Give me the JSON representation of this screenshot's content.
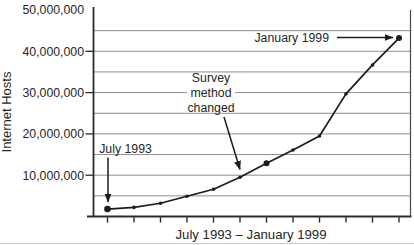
{
  "chart_data": {
    "type": "line",
    "title": "",
    "xlabel": "July 1993 – January 1999",
    "ylabel": "Internet Hosts",
    "x": [
      "Jul 1993",
      "Jan 1994",
      "Jul 1994",
      "Jan 1995",
      "Jul 1995",
      "Jan 1996",
      "Jul 1996",
      "Jan 1997",
      "Jul 1997",
      "Jan 1998",
      "Jul 1998",
      "Jan 1999"
    ],
    "values": [
      1800000,
      2200000,
      3200000,
      4900000,
      6600000,
      9500000,
      12900000,
      16100000,
      19500000,
      29700000,
      36700000,
      43200000
    ],
    "ylim": [
      0,
      50000000
    ],
    "y_ticks": [
      {
        "value": 50000000,
        "label": "50,000,000"
      },
      {
        "value": 40000000,
        "label": "40,000,000"
      },
      {
        "value": 30000000,
        "label": "30,000,000"
      },
      {
        "value": 20000000,
        "label": "20,000,000"
      },
      {
        "value": 10000000,
        "label": "10,000,000"
      }
    ],
    "gridline_interval": 5000000,
    "grid": "horizontal gridlines every 5,000,000",
    "legend": "none",
    "x_tick_labels_shown": false,
    "emphasized_point_indices": [
      0,
      6,
      11
    ],
    "annotations": [
      {
        "text": "July 1993",
        "lines": [
          "July 1993"
        ],
        "points_to_index": 0,
        "arrow": "down"
      },
      {
        "text": "Survey method changed",
        "lines": [
          "Survey",
          "method",
          "changed"
        ],
        "points_to_index": 5,
        "arrow": "down-right"
      },
      {
        "text": "January 1999",
        "lines": [
          "January 1999"
        ],
        "points_to_index": 11,
        "arrow": "right"
      }
    ],
    "colors": {
      "ink": "#2b2b2b",
      "series_line": "#1c1c1c",
      "gridline": "#8f8f8f",
      "page_edge": "#c9c9c9",
      "background": "#ffffff"
    }
  }
}
